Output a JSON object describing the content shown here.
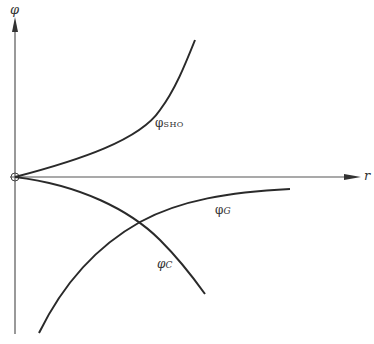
{
  "diagram": {
    "axes": {
      "y_label": "φ",
      "x_label": "r"
    },
    "curves": [
      {
        "id": "sho",
        "symbol": "φ",
        "subscript": "SHO",
        "description": "rising curve from origin (exponentially increasing)"
      },
      {
        "id": "coulomb",
        "symbol": "φ",
        "subscript": "C",
        "description": "decreasing curve from origin"
      },
      {
        "id": "gaussian",
        "symbol": "φ",
        "subscript": "G",
        "description": "curve rising from below toward zero asymptotically"
      }
    ],
    "colors": {
      "line": "#2a2a2a",
      "background": "#ffffff"
    }
  }
}
